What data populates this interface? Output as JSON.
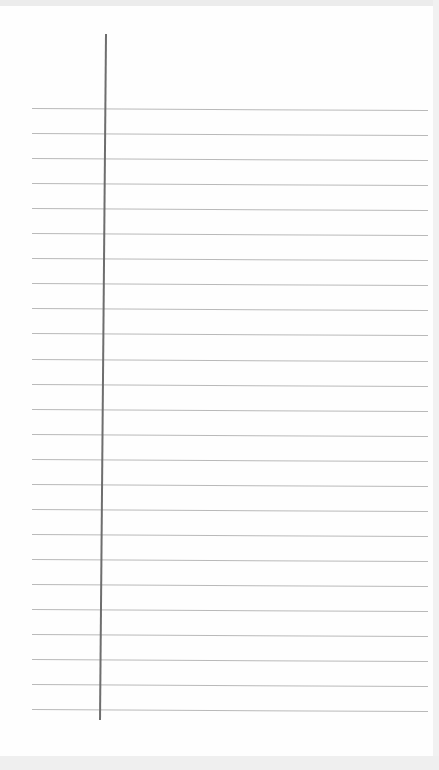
{
  "page": {
    "type": "lined-notebook-paper",
    "background_color": "#fefefe",
    "rule_color": "#b9b9b9",
    "margin_line_color": "#6e6e6e",
    "rules": {
      "count": 25,
      "first_y": 108,
      "spacing": 25.05,
      "x_start": 32,
      "x_end": 428
    },
    "margin_line": {
      "x": 105,
      "y_start": 34,
      "y_end": 720
    }
  }
}
